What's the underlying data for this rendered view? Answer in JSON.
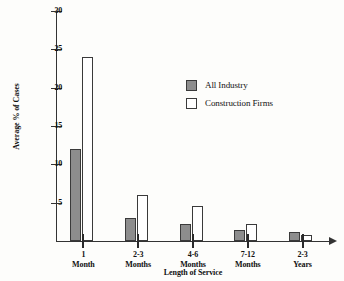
{
  "chart_data": {
    "type": "bar",
    "title": "",
    "xlabel": "Length of Service",
    "ylabel": "Average % of Cases",
    "categories": [
      "1 Month",
      "2-3 Months",
      "4-6 Months",
      "7-12 Months",
      "2-3 Years"
    ],
    "category_lines": [
      {
        "line1": "1",
        "line2": "Month"
      },
      {
        "line1": "2-3",
        "line2": "Months"
      },
      {
        "line1": "4-6",
        "line2": "Months"
      },
      {
        "line1": "7-12",
        "line2": "Months"
      },
      {
        "line1": "2-3",
        "line2": "Years"
      }
    ],
    "series": [
      {
        "name": "All Industry",
        "color": "#8d8d8d",
        "values": [
          12,
          3,
          2.2,
          1.5,
          1.2
        ]
      },
      {
        "name": "Construction Firms",
        "color": "#ffffff",
        "values": [
          24,
          6,
          4.6,
          2.2,
          0.8
        ]
      }
    ],
    "ylim": [
      0,
      30
    ],
    "yticks": [
      5,
      10,
      15,
      20,
      25,
      30
    ],
    "ytick_labels": [
      "5",
      "10",
      "15",
      "20",
      "25",
      "30"
    ],
    "grid": false,
    "legend_position": "center-top"
  },
  "legend": {
    "items": [
      {
        "label": "All Industry"
      },
      {
        "label": "Construction Firms"
      }
    ]
  }
}
